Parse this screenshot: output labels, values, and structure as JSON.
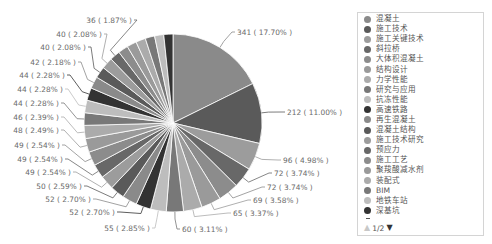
{
  "chart_data": {
    "type": "pie",
    "title": "",
    "label_format": "{value} ( {percent}% )",
    "total": 1927,
    "slices": [
      {
        "name": "混凝土",
        "value": 341,
        "percent": "17.70",
        "color": "#8a8a8a",
        "label": "341 ( 17.70% )",
        "label_shown": true
      },
      {
        "name": "施工技术",
        "value": 212,
        "percent": "11.00",
        "color": "#5a5a5a",
        "label": "212 ( 11.00% )",
        "label_shown": true
      },
      {
        "name": "施工关键技术",
        "value": 96,
        "percent": "4.98",
        "color": "#9c9c9c",
        "label": "96 ( 4.98% )",
        "label_shown": true
      },
      {
        "name": "斜拉桥",
        "value": 72,
        "percent": "3.74",
        "color": "#686868",
        "label": "72 ( 3.74% )",
        "label_shown": true
      },
      {
        "name": "大体积混凝土",
        "value": 72,
        "percent": "3.74",
        "color": "#8c8c8c",
        "label": "72 ( 3.74% )",
        "label_shown": true
      },
      {
        "name": "结构设计",
        "value": 69,
        "percent": "3.58",
        "color": "#9a9a9a",
        "label": "69 ( 3.58% )",
        "label_shown": true
      },
      {
        "name": "力学性能",
        "value": 65,
        "percent": "3.37",
        "color": "#ababab",
        "label": "65 ( 3.37% )",
        "label_shown": true
      },
      {
        "name": "研究与应用",
        "value": 60,
        "percent": "3.11",
        "color": "#787878",
        "label": "60 ( 3.11% )",
        "label_shown": true
      },
      {
        "name": "抗冻性能",
        "value": 55,
        "percent": "2.85",
        "color": "#bdbdbd",
        "label": "55 ( 2.85% )",
        "label_shown": true
      },
      {
        "name": "高速铁路",
        "value": 52,
        "percent": "2.70",
        "color": "#333333",
        "label": "52 ( 2.70% )",
        "label_shown": true
      },
      {
        "name": "再生混凝土",
        "value": 52,
        "percent": "2.70",
        "color": "#8a8a8a",
        "label": "52 ( 2.70% )",
        "label_shown": true
      },
      {
        "name": "混凝土结构",
        "value": 50,
        "percent": "2.59",
        "color": "#5a5a5a",
        "label": "50 ( 2.59% )",
        "label_shown": true
      },
      {
        "name": "施工技术研究",
        "value": 49,
        "percent": "2.54",
        "color": "#9c9c9c",
        "label": "49 ( 2.54% )",
        "label_shown": true
      },
      {
        "name": "预应力",
        "value": 49,
        "percent": "2.54",
        "color": "#686868",
        "label": "49 ( 2.54% )",
        "label_shown": true
      },
      {
        "name": "施工工艺",
        "value": 49,
        "percent": "2.54",
        "color": "#8c8c8c",
        "label": "49 ( 2.54% )",
        "label_shown": true
      },
      {
        "name": "聚羧酸减水剂",
        "value": 48,
        "percent": "2.49",
        "color": "#9a9a9a",
        "label": "48 ( 2.49% )",
        "label_shown": true
      },
      {
        "name": "装配式",
        "value": 46,
        "percent": "2.39",
        "color": "#ababab",
        "label": "46 ( 2.39% )",
        "label_shown": true
      },
      {
        "name": "BIM",
        "value": 44,
        "percent": "2.28",
        "color": "#787878",
        "label": "44 ( 2.28% )",
        "label_shown": true
      },
      {
        "name": "地铁车站",
        "value": 44,
        "percent": "2.28",
        "color": "#bdbdbd",
        "label": "44 ( 2.28% )",
        "label_shown": true
      },
      {
        "name": "深基坑",
        "value": 44,
        "percent": "2.28",
        "color": "#333333",
        "label": "44 ( 2.28% )",
        "label_shown": true
      },
      {
        "name": "",
        "value": 42,
        "percent": "2.18",
        "color": "#8a8a8a",
        "label": "42 ( 2.18% )",
        "label_shown": true
      },
      {
        "name": "",
        "value": 40,
        "percent": "2.08",
        "color": "#5a5a5a",
        "label": "40 ( 2.08% )",
        "label_shown": true
      },
      {
        "name": "",
        "value": 40,
        "percent": "2.08",
        "color": "#9c9c9c",
        "label": "40 ( 2.08% )",
        "label_shown": true
      },
      {
        "name": "",
        "value": 36,
        "percent": "1.87",
        "color": "#686868",
        "label": "36 ( 1.87% )",
        "label_shown": true
      },
      {
        "name": "",
        "value": 35,
        "color": "#8c8c8c",
        "label_shown": false,
        "estimated": true
      },
      {
        "name": "",
        "value": 34,
        "color": "#9a9a9a",
        "label_shown": false,
        "estimated": true
      },
      {
        "name": "",
        "value": 34,
        "color": "#ababab",
        "label_shown": false,
        "estimated": true
      },
      {
        "name": "",
        "value": 33,
        "color": "#787878",
        "label_shown": false,
        "estimated": true
      },
      {
        "name": "",
        "value": 32,
        "color": "#bdbdbd",
        "label_shown": false,
        "estimated": true
      },
      {
        "name": "",
        "value": 32,
        "color": "#333333",
        "label_shown": false,
        "estimated": true
      }
    ],
    "legend": {
      "placement": "right",
      "items": [
        "混凝土",
        "施工技术",
        "施工关键技术",
        "斜拉桥",
        "大体积混凝土",
        "结构设计",
        "力学性能",
        "研究与应用",
        "抗冻性能",
        "高速铁路",
        "再生混凝土",
        "混凝土结构",
        "施工技术研究",
        "预应力",
        "施工工艺",
        "聚羧酸减水剂",
        "装配式",
        "BIM",
        "地铁车站",
        "深基坑"
      ],
      "colors": [
        "#8a8a8a",
        "#5a5a5a",
        "#9c9c9c",
        "#686868",
        "#8c8c8c",
        "#9a9a9a",
        "#ababab",
        "#787878",
        "#bdbdbd",
        "#333333",
        "#8a8a8a",
        "#5a5a5a",
        "#9c9c9c",
        "#686868",
        "#8c8c8c",
        "#9a9a9a",
        "#ababab",
        "#787878",
        "#bdbdbd",
        "#333333"
      ],
      "page": {
        "current": 1,
        "total": 2,
        "text": "1/2",
        "prev_icon": "▲",
        "next_icon": "▼"
      }
    }
  }
}
